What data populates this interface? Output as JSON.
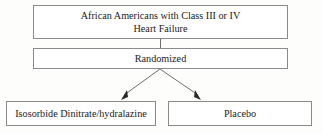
{
  "diagram": {
    "type": "flowchart",
    "orientation": "top-down",
    "background_color": "#fdfdfc",
    "border_color": "#8a8a8a",
    "text_color": "#1a1a1a",
    "nodes": [
      {
        "id": "population",
        "role": "study-population",
        "label": "African Americans with Class III or IV\nHeart Failure",
        "line1": "African Americans with Class III or IV",
        "line2": "Heart Failure"
      },
      {
        "id": "randomized",
        "role": "randomization-step",
        "label": "Randomized"
      },
      {
        "id": "treatment",
        "role": "treatment-arm",
        "label": "Isosorbide Dinitrate/hydralazine"
      },
      {
        "id": "control",
        "role": "control-arm",
        "label": "Placebo"
      }
    ],
    "edges": [
      {
        "id": "population-to-randomized",
        "from": "population",
        "to": "randomized",
        "style": "plain-line",
        "arrowhead": false
      },
      {
        "id": "randomized-to-treatment",
        "from": "randomized",
        "to": "treatment",
        "style": "diagonal-line",
        "arrowhead": true
      },
      {
        "id": "randomized-to-control",
        "from": "randomized",
        "to": "control",
        "style": "diagonal-line",
        "arrowhead": true
      }
    ]
  }
}
